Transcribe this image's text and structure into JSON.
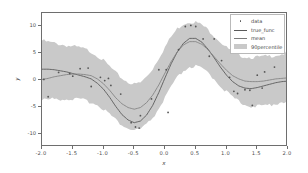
{
  "chart_data": {
    "type": "line",
    "title": "",
    "xlabel": "x",
    "ylabel": "y",
    "xlim": [
      -2.0,
      2.0
    ],
    "ylim": [
      -12.4,
      12.4
    ],
    "grid": false,
    "legend_position": "upper right",
    "xticks": [
      "-2.0",
      "-1.5",
      "-1.0",
      "-0.5",
      "0.0",
      "0.5",
      "1.0",
      "1.5",
      "2.0"
    ],
    "xtick_values": [
      -2.0,
      -1.5,
      -1.0,
      -0.5,
      0.0,
      0.5,
      1.0,
      1.5,
      2.0
    ],
    "yticks": [
      "10",
      "5",
      "0",
      "-5",
      "-10"
    ],
    "ytick_values": [
      10,
      5,
      0,
      -5,
      -10
    ],
    "legend": [
      {
        "label": "data",
        "kind": "marker",
        "color": "#555555"
      },
      {
        "label": "true_func",
        "kind": "line",
        "color": "#5a5a5a"
      },
      {
        "label": "mean",
        "kind": "line",
        "color": "#7a7a7a"
      },
      {
        "label": "90percentile",
        "kind": "band",
        "color": "#c9c9c9"
      }
    ],
    "series": [
      {
        "name": "true_func",
        "kind": "line",
        "color": "#5a5a5a",
        "x": [
          -2.0,
          -1.9,
          -1.8,
          -1.7,
          -1.6,
          -1.5,
          -1.4,
          -1.3,
          -1.2,
          -1.1,
          -1.0,
          -0.9,
          -0.8,
          -0.7,
          -0.6,
          -0.5,
          -0.4,
          -0.3,
          -0.2,
          -0.1,
          0.0,
          0.1,
          0.2,
          0.3,
          0.4,
          0.5,
          0.6,
          0.7,
          0.8,
          0.9,
          1.0,
          1.1,
          1.2,
          1.3,
          1.4,
          1.5,
          1.6,
          1.7,
          1.8,
          1.9,
          2.0
        ],
        "y": [
          2.0,
          2.0,
          1.9,
          1.7,
          1.5,
          1.2,
          0.9,
          0.6,
          0.2,
          -0.6,
          -1.7,
          -3.2,
          -4.9,
          -6.4,
          -7.4,
          -7.9,
          -7.6,
          -6.5,
          -4.7,
          -2.3,
          0.4,
          3.0,
          5.2,
          6.8,
          7.7,
          7.7,
          7.0,
          5.7,
          4.1,
          2.4,
          0.9,
          -0.3,
          -1.1,
          -1.5,
          -1.6,
          -1.4,
          -1.1,
          -0.8,
          -0.5,
          -0.3,
          -0.2
        ]
      },
      {
        "name": "mean",
        "kind": "line",
        "color": "#7a7a7a",
        "x": [
          -2.0,
          -1.9,
          -1.8,
          -1.7,
          -1.6,
          -1.5,
          -1.4,
          -1.3,
          -1.2,
          -1.1,
          -1.0,
          -0.9,
          -0.8,
          -0.7,
          -0.6,
          -0.5,
          -0.4,
          -0.3,
          -0.2,
          -0.1,
          0.0,
          0.1,
          0.2,
          0.3,
          0.4,
          0.5,
          0.6,
          0.7,
          0.8,
          0.9,
          1.0,
          1.1,
          1.2,
          1.3,
          1.4,
          1.5,
          1.6,
          1.7,
          1.8,
          1.9,
          2.0
        ],
        "y": [
          0.1,
          0.3,
          0.6,
          0.8,
          1.0,
          1.1,
          1.1,
          1.0,
          0.8,
          0.2,
          -0.7,
          -1.9,
          -3.3,
          -4.4,
          -5.1,
          -5.4,
          -5.1,
          -4.2,
          -2.8,
          -0.9,
          1.3,
          3.4,
          5.2,
          6.5,
          7.1,
          7.1,
          6.6,
          5.6,
          4.3,
          3.0,
          1.8,
          0.8,
          0.2,
          -0.2,
          -0.3,
          -0.3,
          -0.2,
          0.0,
          0.2,
          0.3,
          0.4
        ]
      },
      {
        "name": "90percentile",
        "kind": "band",
        "color": "#c9c9c9",
        "x": [
          -2.0,
          -1.9,
          -1.8,
          -1.7,
          -1.6,
          -1.5,
          -1.4,
          -1.3,
          -1.2,
          -1.1,
          -1.0,
          -0.9,
          -0.8,
          -0.7,
          -0.6,
          -0.5,
          -0.4,
          -0.3,
          -0.2,
          -0.1,
          0.0,
          0.1,
          0.2,
          0.3,
          0.4,
          0.5,
          0.6,
          0.7,
          0.8,
          0.9,
          1.0,
          1.1,
          1.2,
          1.3,
          1.4,
          1.5,
          1.6,
          1.7,
          1.8,
          1.9,
          2.0
        ],
        "upper": [
          7.3,
          7.0,
          6.8,
          6.6,
          6.4,
          6.2,
          6.0,
          5.7,
          5.2,
          4.5,
          3.6,
          2.5,
          1.3,
          0.3,
          -0.4,
          -0.8,
          -0.5,
          0.6,
          2.1,
          4.1,
          6.1,
          8.0,
          9.5,
          10.4,
          10.8,
          10.7,
          10.2,
          9.3,
          8.2,
          7.1,
          6.0,
          5.2,
          4.6,
          4.3,
          4.2,
          4.2,
          4.3,
          4.4,
          4.6,
          4.8,
          5.0
        ],
        "lower": [
          -3.7,
          -3.6,
          -3.5,
          -3.5,
          -3.5,
          -3.5,
          -3.6,
          -3.8,
          -4.1,
          -4.6,
          -5.3,
          -6.3,
          -7.4,
          -8.3,
          -9.0,
          -9.3,
          -9.1,
          -8.3,
          -7.0,
          -5.3,
          -3.3,
          -1.3,
          0.4,
          1.7,
          2.4,
          2.5,
          2.1,
          1.3,
          0.2,
          -1.0,
          -2.2,
          -3.2,
          -4.0,
          -4.5,
          -4.8,
          -4.9,
          -4.8,
          -4.6,
          -4.3,
          -4.1,
          -3.9
        ]
      },
      {
        "name": "data",
        "kind": "scatter",
        "color": "#555555",
        "points": [
          [
            -1.97,
            0.1
          ],
          [
            -1.9,
            -3.1
          ],
          [
            -1.73,
            1.4
          ],
          [
            -1.55,
            1.2
          ],
          [
            -1.5,
            0.7
          ],
          [
            -1.38,
            2.1
          ],
          [
            -1.25,
            2.2
          ],
          [
            -1.2,
            -1.2
          ],
          [
            -1.05,
            0.5
          ],
          [
            -0.98,
            -0.1
          ],
          [
            -0.92,
            0.3
          ],
          [
            -0.88,
            -1.0
          ],
          [
            -0.72,
            -2.6
          ],
          [
            -0.55,
            -7.9
          ],
          [
            -0.48,
            -8.7
          ],
          [
            -0.42,
            -8.9
          ],
          [
            -0.4,
            -6.6
          ],
          [
            -0.22,
            -3.5
          ],
          [
            -0.1,
            1.9
          ],
          [
            0.02,
            1.9
          ],
          [
            0.05,
            -6.0
          ],
          [
            0.22,
            5.6
          ],
          [
            0.33,
            9.9
          ],
          [
            0.42,
            10.1
          ],
          [
            0.5,
            9.9
          ],
          [
            0.62,
            7.6
          ],
          [
            0.72,
            4.4
          ],
          [
            0.8,
            7.6
          ],
          [
            0.92,
            3.6
          ],
          [
            1.05,
            0.5
          ],
          [
            1.12,
            -2.1
          ],
          [
            1.18,
            -2.5
          ],
          [
            1.3,
            -1.8
          ],
          [
            1.38,
            -1.9
          ],
          [
            1.42,
            -4.7
          ],
          [
            1.5,
            0.9
          ],
          [
            1.58,
            -1.5
          ],
          [
            1.62,
            1.5
          ],
          [
            1.78,
            2.4
          ]
        ]
      }
    ]
  }
}
